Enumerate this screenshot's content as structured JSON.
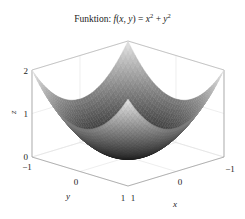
{
  "chart_data": {
    "type": "surface3d",
    "title_prefix": "Funktion: ",
    "title_math": "f(x, y) = x² + y²",
    "function": "x^2 + y^2",
    "x": {
      "label": "x",
      "range": [
        -1,
        1
      ],
      "ticks": [
        "-1",
        "0",
        "1"
      ]
    },
    "y": {
      "label": "y",
      "range": [
        -1,
        1
      ],
      "ticks": [
        "-1",
        "0",
        "1"
      ]
    },
    "z": {
      "label": "z",
      "range": [
        0,
        2
      ],
      "ticks": [
        "0",
        "1",
        "2"
      ]
    },
    "grid": true,
    "colormap": "gray",
    "legend": null
  },
  "labels": {
    "title_prefix": "Funktion: ",
    "xlabel": "x",
    "ylabel": "y",
    "zlabel": "z"
  }
}
